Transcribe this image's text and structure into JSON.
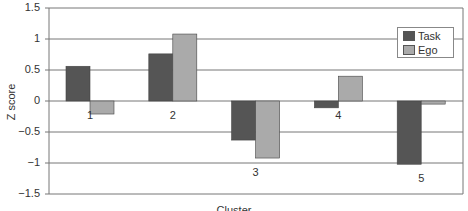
{
  "chart_data": {
    "type": "bar",
    "title": "",
    "xlabel": "Cluster",
    "ylabel": "Z score",
    "ylim": [
      -1.5,
      1.5
    ],
    "yticks": [
      "1.5",
      "1",
      "0.5",
      "0",
      "-0.5",
      "-1",
      "-1.5"
    ],
    "grid": true,
    "legend_position": "upper right",
    "categories": [
      "1",
      "2",
      "3",
      "4",
      "5"
    ],
    "series": [
      {
        "name": "Task",
        "color": "#555555",
        "values": [
          0.56,
          0.76,
          -0.63,
          -0.11,
          -1.02
        ]
      },
      {
        "name": "Ego",
        "color": "#aaaaaa",
        "values": [
          -0.21,
          1.08,
          -0.92,
          0.4,
          -0.05
        ]
      }
    ]
  },
  "legend": {
    "task": "Task",
    "ego": "Ego"
  },
  "axis": {
    "y_label": "Z score",
    "x_label": "Cluster"
  }
}
